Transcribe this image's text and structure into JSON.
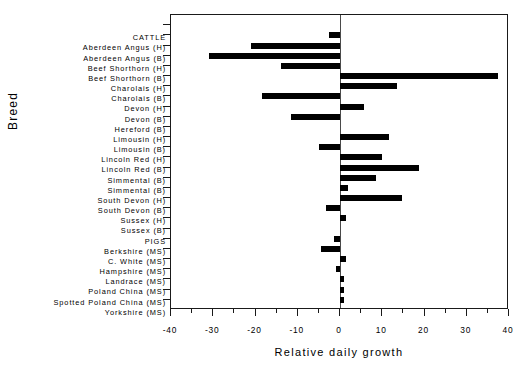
{
  "chart_data": {
    "type": "bar",
    "orientation": "horizontal",
    "title": "",
    "xlabel": "Relative daily growth",
    "ylabel": "Breed",
    "xlim": [
      -40,
      40
    ],
    "xticks": [
      -40,
      -30,
      -20,
      -10,
      0,
      10,
      20,
      30,
      40
    ],
    "xticklabels": [
      "-40",
      "-30",
      "-20",
      "-10",
      "0",
      "10",
      "20",
      "30",
      "40"
    ],
    "grid": false,
    "legend": null,
    "categories": [
      "CATTLE",
      "Aberdeen Angus (H)",
      "Aberdeen Angus (B)",
      "Beef Shorthorn (H)",
      "Beef Shorthorn (B)",
      "Charolais (H)",
      "Charolais (B)",
      "Devon (H)",
      "Devon (B)",
      "Hereford (B)",
      "Limousin (H)",
      "Limousin (B)",
      "Lincoln Red (H)",
      "Lincoln Red (B)",
      "Simmental (B)",
      "Simmental (B)",
      "South Devon (H)",
      "South Devon (B)",
      "Sussex (H)",
      "Sussex (B)",
      "PIGS",
      "Berkshire (MS)",
      "C. White (MS)",
      "Hampshire (MS)",
      "Landrace (MS)",
      "Poland China (MS)",
      "Spotted Poland China (MS)",
      "Yorkshire (MS)"
    ],
    "values": [
      null,
      -2.6,
      -21.0,
      -31.0,
      -14.0,
      37.5,
      13.5,
      -18.5,
      5.7,
      -11.5,
      null,
      11.6,
      -5.0,
      10.0,
      18.7,
      8.5,
      2.0,
      14.7,
      -3.3,
      1.4,
      null,
      -1.5,
      -4.5,
      1.5,
      -1.0,
      1.0,
      1.0,
      1.0
    ]
  },
  "colors": {
    "bar": "#000000",
    "axis": "#1a1a1a",
    "zero_line": "#4a4a4a",
    "background": "#ffffff"
  }
}
